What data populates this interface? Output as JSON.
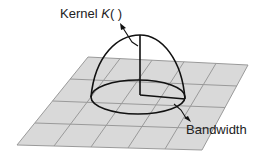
{
  "diagram": {
    "labels": {
      "kernel_prefix": "Kernel ",
      "kernel_symbol": "K",
      "kernel_suffix": "( )",
      "bandwidth": "Bandwidth"
    },
    "grid": {
      "columns": 5,
      "rows": 4,
      "fill": "#d9d9d9",
      "line": "#9a9a9a"
    },
    "colors": {
      "curve": "#111111",
      "background": "#ffffff"
    }
  }
}
